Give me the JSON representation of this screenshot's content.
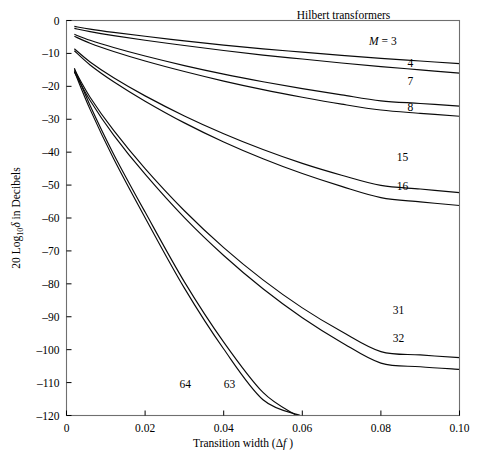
{
  "chart_data": {
    "type": "line",
    "title": "Hilbert transformers",
    "xlabel": "Transition width (Δf)",
    "ylabel": "20 Log₁₀δ in Decibels",
    "xlim": [
      0.0,
      0.1
    ],
    "ylim": [
      -120,
      0
    ],
    "xticks": [
      0,
      0.02,
      0.04,
      0.06,
      0.08,
      0.1
    ],
    "xtick_labels": [
      "0",
      "0.02",
      "0.04",
      "0.06",
      "0.08",
      "0.10"
    ],
    "yticks": [
      0,
      -10,
      -20,
      -30,
      -40,
      -50,
      -60,
      -70,
      -80,
      -90,
      -100,
      -110,
      -120
    ],
    "ytick_labels": [
      "0",
      "–10",
      "–20",
      "–30",
      "–40",
      "–50",
      "–60",
      "–70",
      "–80",
      "–90",
      "–100",
      "–110",
      "–120"
    ],
    "grid": false,
    "legend_position": "inline-right",
    "series": [
      {
        "name": "M = 3",
        "label": "M = 3",
        "x": [
          0.002,
          0.006,
          0.012,
          0.02,
          0.03,
          0.04,
          0.05,
          0.06,
          0.07,
          0.08,
          0.09,
          0.1
        ],
        "y": [
          -1.8,
          -2.6,
          -3.6,
          -4.8,
          -6.2,
          -7.5,
          -8.6,
          -9.6,
          -10.6,
          -11.5,
          -12.3,
          -13.1
        ]
      },
      {
        "name": "4",
        "label": "4",
        "x": [
          0.002,
          0.006,
          0.012,
          0.02,
          0.03,
          0.04,
          0.05,
          0.06,
          0.07,
          0.08,
          0.09,
          0.1
        ],
        "y": [
          -2.4,
          -3.4,
          -4.6,
          -6.0,
          -7.6,
          -9.1,
          -10.5,
          -11.7,
          -12.9,
          -14.0,
          -15.0,
          -16.0
        ]
      },
      {
        "name": "7",
        "label": "7",
        "x": [
          0.002,
          0.006,
          0.012,
          0.02,
          0.03,
          0.04,
          0.05,
          0.06,
          0.07,
          0.08,
          0.09,
          0.1
        ],
        "y": [
          -4.2,
          -6.0,
          -8.2,
          -10.8,
          -13.7,
          -16.3,
          -18.6,
          -20.7,
          -22.6,
          -24.4,
          -25.2,
          -26.0
        ]
      },
      {
        "name": "8",
        "label": "8",
        "x": [
          0.002,
          0.006,
          0.012,
          0.02,
          0.03,
          0.04,
          0.05,
          0.06,
          0.07,
          0.08,
          0.09,
          0.1
        ],
        "y": [
          -4.8,
          -6.9,
          -9.4,
          -12.3,
          -15.5,
          -18.4,
          -21.0,
          -23.3,
          -25.4,
          -27.2,
          -28.2,
          -29.1
        ]
      },
      {
        "name": "15",
        "label": "15",
        "x": [
          0.002,
          0.006,
          0.012,
          0.02,
          0.03,
          0.04,
          0.05,
          0.06,
          0.07,
          0.08,
          0.09,
          0.1
        ],
        "y": [
          -8.6,
          -12.6,
          -17.4,
          -22.9,
          -29.0,
          -34.4,
          -39.2,
          -43.4,
          -47.0,
          -50.1,
          -51.2,
          -52.3
        ]
      },
      {
        "name": "16",
        "label": "16",
        "x": [
          0.002,
          0.006,
          0.012,
          0.02,
          0.03,
          0.04,
          0.05,
          0.06,
          0.07,
          0.08,
          0.09,
          0.1
        ],
        "y": [
          -9.2,
          -13.5,
          -18.6,
          -24.5,
          -31.1,
          -36.9,
          -42.0,
          -46.5,
          -50.4,
          -53.8,
          -55.1,
          -56.2
        ]
      },
      {
        "name": "31",
        "label": "31",
        "x": [
          0.002,
          0.006,
          0.012,
          0.02,
          0.03,
          0.04,
          0.05,
          0.06,
          0.07,
          0.08,
          0.09,
          0.1
        ],
        "y": [
          -14.9,
          -23.3,
          -33.4,
          -45.0,
          -57.8,
          -69.0,
          -78.8,
          -87.3,
          -94.5,
          -100.6,
          -101.6,
          -102.4
        ]
      },
      {
        "name": "32",
        "label": "32",
        "x": [
          0.002,
          0.006,
          0.012,
          0.02,
          0.03,
          0.04,
          0.05,
          0.06,
          0.07,
          0.08,
          0.09,
          0.1
        ],
        "y": [
          -15.6,
          -24.3,
          -34.8,
          -46.7,
          -59.9,
          -71.4,
          -81.5,
          -90.3,
          -97.8,
          -104.1,
          -105.2,
          -106.0
        ]
      },
      {
        "name": "63",
        "label": "63",
        "x": [
          0.002,
          0.006,
          0.012,
          0.02,
          0.03,
          0.04,
          0.05,
          0.0585
        ],
        "y": [
          -14.5,
          -25.8,
          -40.6,
          -58.2,
          -79.4,
          -97.7,
          -113.0,
          -120.0
        ]
      },
      {
        "name": "64",
        "label": "64",
        "x": [
          0.002,
          0.006,
          0.012,
          0.02,
          0.03,
          0.04,
          0.05,
          0.0595
        ],
        "y": [
          -15.4,
          -27.0,
          -42.0,
          -59.9,
          -81.3,
          -99.8,
          -115.2,
          -120.0
        ]
      }
    ],
    "curve_labels": [
      {
        "text": "M = 3",
        "x": 0.0805,
        "y": -6.3
      },
      {
        "text": "4",
        "x": 0.0875,
        "y": -13.0
      },
      {
        "text": "7",
        "x": 0.0875,
        "y": -18.5
      },
      {
        "text": "8",
        "x": 0.0875,
        "y": -26.2
      },
      {
        "text": "15",
        "x": 0.0855,
        "y": -41.5
      },
      {
        "text": "16",
        "x": 0.0855,
        "y": -50.3
      },
      {
        "text": "31",
        "x": 0.0845,
        "y": -88.0
      },
      {
        "text": "32",
        "x": 0.0845,
        "y": -96.5
      },
      {
        "text": "64",
        "x": 0.0302,
        "y": -110.5
      },
      {
        "text": "63",
        "x": 0.0415,
        "y": -110.5
      }
    ],
    "title_position": {
      "x": 0.0705,
      "y": 1.8
    }
  },
  "colors": {
    "curve": "#0a0a0a",
    "frame": "#6f6f6f",
    "background": "#ffffff",
    "text": "#000000"
  }
}
